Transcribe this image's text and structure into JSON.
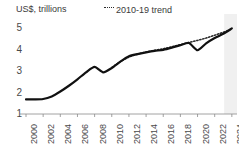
{
  "chart_data": {
    "type": "line",
    "title": "",
    "subtitle": "",
    "ylabel": "US$, trillions",
    "xlabel": "",
    "ylim": [
      1,
      5.3
    ],
    "xlim": [
      2000,
      2024.6
    ],
    "yticks": [
      "5",
      "4",
      "3",
      "2",
      "1"
    ],
    "ytick_values": [
      5,
      4,
      3,
      2,
      1
    ],
    "xticks": [
      "2000",
      "2002",
      "2004",
      "2006",
      "2008",
      "2010",
      "2012",
      "2014",
      "2016",
      "2018",
      "2020",
      "2022",
      "2024"
    ],
    "xtick_values": [
      2000,
      2002,
      2004,
      2006,
      2008,
      2010,
      2012,
      2014,
      2016,
      2018,
      2020,
      2022,
      2024
    ],
    "grid": false,
    "legend_position": "top-center",
    "legend": [
      {
        "label": "2010-19 trend",
        "style": "dotted",
        "color": "#2b2b2b"
      }
    ],
    "series": [
      {
        "name": "actual",
        "style": "solid",
        "color": "#111111",
        "x": [
          2000,
          2001,
          2002,
          2003,
          2004,
          2005,
          2006,
          2007,
          2008,
          2009,
          2010,
          2011,
          2012,
          2013,
          2014,
          2015,
          2016,
          2017,
          2018,
          2019,
          2020,
          2021,
          2022,
          2023,
          2024
        ],
        "values": [
          1.68,
          1.68,
          1.7,
          1.82,
          2.05,
          2.32,
          2.62,
          2.95,
          3.2,
          2.95,
          3.15,
          3.45,
          3.7,
          3.8,
          3.88,
          3.95,
          4.0,
          4.1,
          4.22,
          4.32,
          3.98,
          4.3,
          4.55,
          4.75,
          5.0
        ]
      },
      {
        "name": "2010-19 trend",
        "style": "dotted",
        "color": "#2b2b2b",
        "x": [
          2010,
          2011,
          2012,
          2013,
          2014,
          2015,
          2016,
          2017,
          2018,
          2019,
          2020,
          2021,
          2022,
          2023,
          2024
        ],
        "values": [
          3.18,
          3.45,
          3.66,
          3.8,
          3.9,
          3.98,
          4.05,
          4.14,
          4.24,
          4.34,
          4.44,
          4.55,
          4.68,
          4.82,
          4.98
        ]
      }
    ],
    "shaded_region": {
      "label": "forecast",
      "x_start": 2023.1,
      "x_end": 2024.6,
      "color": "#f0f0f0"
    },
    "colors": {
      "line": "#111111",
      "trend": "#2b2b2b",
      "axis": "#6b6b6b",
      "text": "#4a4a4a",
      "shade": "#f0f0f0",
      "background": "#ffffff"
    }
  }
}
